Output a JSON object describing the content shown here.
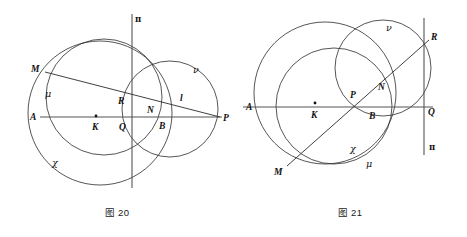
{
  "page": {
    "background_color": "#ffffff",
    "width": 467,
    "height": 237,
    "stroke_color": "#2b2b2b",
    "axis_color": "#555555",
    "label_color": "#111111"
  },
  "figures": [
    {
      "id": "figure-20",
      "caption": "图 20",
      "origin_x": 0,
      "circles": [
        {
          "name": "chi",
          "cx": 100,
          "cy": 113,
          "r": 72
        },
        {
          "name": "mu",
          "cx": 104,
          "cy": 97,
          "r": 58
        },
        {
          "name": "nu",
          "cx": 170,
          "cy": 109,
          "r": 48
        }
      ],
      "lines": [
        {
          "name": "axis-AP",
          "x1": 40,
          "y1": 117,
          "x2": 222,
          "y2": 117,
          "kind": "axis"
        },
        {
          "name": "axis-pi-vertical",
          "x1": 132,
          "y1": 14,
          "x2": 132,
          "y2": 188,
          "kind": "axis"
        },
        {
          "name": "secant-MP",
          "x1": 45,
          "y1": 72,
          "x2": 220,
          "y2": 117,
          "kind": "geo"
        }
      ],
      "dots": [
        {
          "name": "center-K",
          "cx": 96,
          "cy": 116,
          "r": 1.4
        }
      ],
      "labels": [
        {
          "name": "label-A",
          "text": "A",
          "x": 30,
          "y": 120,
          "style": "pt"
        },
        {
          "name": "label-M",
          "text": "M",
          "x": 31,
          "y": 72,
          "style": "pt"
        },
        {
          "name": "label-mu",
          "text": "μ",
          "x": 45,
          "y": 97,
          "style": "greek"
        },
        {
          "name": "label-K",
          "text": "K",
          "x": 92,
          "y": 130,
          "style": "pt"
        },
        {
          "name": "label-Q",
          "text": "Q",
          "x": 119,
          "y": 130,
          "style": "pt"
        },
        {
          "name": "label-R",
          "text": "R",
          "x": 118,
          "y": 104,
          "style": "pt"
        },
        {
          "name": "label-N",
          "text": "N",
          "x": 147,
          "y": 113,
          "style": "pt"
        },
        {
          "name": "label-B",
          "text": "B",
          "x": 159,
          "y": 129,
          "style": "pt"
        },
        {
          "name": "label-l",
          "text": "l",
          "x": 180,
          "y": 101,
          "style": "pt"
        },
        {
          "name": "label-nu",
          "text": "ν",
          "x": 193,
          "y": 73,
          "style": "greek"
        },
        {
          "name": "label-chi",
          "text": "χ",
          "x": 52,
          "y": 166,
          "style": "greek"
        },
        {
          "name": "label-P",
          "text": "P",
          "x": 223,
          "y": 121,
          "style": "pt"
        },
        {
          "name": "label-pi",
          "text": "π",
          "x": 135,
          "y": 22,
          "style": "greek-up"
        }
      ]
    },
    {
      "id": "figure-21",
      "caption": "图 21",
      "origin_x": 233,
      "circles": [
        {
          "name": "chi",
          "cx": 92,
          "cy": 93,
          "r": 71
        },
        {
          "name": "mu",
          "cx": 101,
          "cy": 106,
          "r": 58
        },
        {
          "name": "nu",
          "cx": 150,
          "cy": 68,
          "r": 48
        }
      ],
      "lines": [
        {
          "name": "axis-AQ",
          "x1": 10,
          "y1": 107,
          "x2": 200,
          "y2": 107,
          "kind": "axis"
        },
        {
          "name": "axis-pi-vertical",
          "x1": 191,
          "y1": 18,
          "x2": 191,
          "y2": 155,
          "kind": "axis"
        },
        {
          "name": "secant-MR",
          "x1": 54,
          "y1": 166,
          "x2": 196,
          "y2": 40,
          "kind": "geo"
        }
      ],
      "dots": [
        {
          "name": "center-K",
          "cx": 82,
          "cy": 103,
          "r": 1.4
        }
      ],
      "labels": [
        {
          "name": "label-A",
          "text": "A",
          "x": 13,
          "y": 110,
          "style": "pt"
        },
        {
          "name": "label-nu",
          "text": "ν",
          "x": 153,
          "y": 31,
          "style": "greek"
        },
        {
          "name": "label-R",
          "text": "R",
          "x": 198,
          "y": 40,
          "style": "pt"
        },
        {
          "name": "label-K",
          "text": "K",
          "x": 78,
          "y": 118,
          "style": "pt"
        },
        {
          "name": "label-P",
          "text": "P",
          "x": 117,
          "y": 98,
          "style": "pt"
        },
        {
          "name": "label-N",
          "text": "N",
          "x": 145,
          "y": 90,
          "style": "pt"
        },
        {
          "name": "label-B",
          "text": "B",
          "x": 136,
          "y": 119,
          "style": "pt"
        },
        {
          "name": "label-Q",
          "text": "Q",
          "x": 195,
          "y": 115,
          "style": "pt"
        },
        {
          "name": "label-chi",
          "text": "χ",
          "x": 117,
          "y": 152,
          "style": "greek"
        },
        {
          "name": "label-mu",
          "text": "μ",
          "x": 133,
          "y": 167,
          "style": "greek"
        },
        {
          "name": "label-M",
          "text": "M",
          "x": 41,
          "y": 175,
          "style": "pt"
        },
        {
          "name": "label-pi",
          "text": "π",
          "x": 196,
          "y": 150,
          "style": "greek-up"
        }
      ]
    }
  ]
}
